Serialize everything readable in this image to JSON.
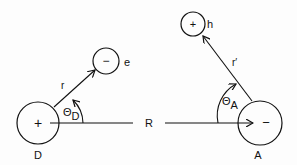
{
  "diagram": {
    "donor": {
      "label": "D",
      "sign": "+"
    },
    "electron": {
      "label": "e",
      "sign": "−"
    },
    "acceptor": {
      "label": "A",
      "sign": "−"
    },
    "hole": {
      "label": "h",
      "sign": "+"
    },
    "r_label": "r",
    "r_prime_label": "r′",
    "R_label": "R",
    "theta_D": {
      "symbol": "Θ",
      "sub": "D"
    },
    "theta_A": {
      "symbol": "Θ",
      "sub": "A"
    },
    "colors": {
      "stroke": "#111111",
      "background": "#fdfdfd"
    }
  }
}
